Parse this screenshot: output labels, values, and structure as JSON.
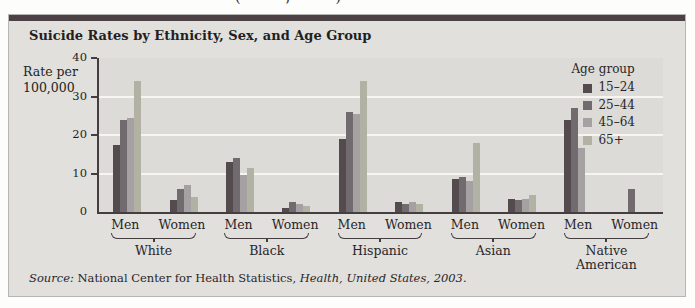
{
  "page": {
    "cropped_top_text": "(  ,  )"
  },
  "panel": {
    "title": "Suicide Rates by Ethnicity, Sex, and Age Group",
    "topbar_color": "#4c4245",
    "background_color": "#e1e0dd",
    "source": {
      "prefix_italic": "Source:",
      "middle": " National Center for Health Statistics, ",
      "citation_italic": "Health, United States, 2003",
      "suffix": "."
    }
  },
  "chart_data": {
    "type": "bar",
    "title": "Suicide Rates by Ethnicity, Sex, and Age Group",
    "ylabel_line1": "Rate per",
    "ylabel_line2": "100,000",
    "ylim": [
      0,
      40
    ],
    "yticks": [
      0,
      10,
      20,
      30,
      40
    ],
    "gridlines_at": [
      10,
      20,
      30
    ],
    "grid_color": "#f6f5f2",
    "plot_bg": "#dcdbd8",
    "axis_color": "#443e40",
    "legend": {
      "title": "Age group",
      "position": "top-right",
      "entries": [
        "15–24",
        "25–44",
        "45–64",
        "65+"
      ],
      "colors": [
        "#534b4d",
        "#716a6e",
        "#a5a1a2",
        "#b1b2a4"
      ]
    },
    "categories": [
      "White",
      "Black",
      "Hispanic",
      "Asian",
      "Native American"
    ],
    "groups": [
      {
        "ethnicity": "White",
        "clusters": [
          {
            "sex": "Men",
            "values": [
              17.5,
              24,
              24.5,
              34
            ]
          },
          {
            "sex": "Women",
            "values": [
              3,
              6,
              7,
              4
            ]
          }
        ]
      },
      {
        "ethnicity": "Black",
        "clusters": [
          {
            "sex": "Men",
            "values": [
              13,
              14,
              9.5,
              11.5
            ]
          },
          {
            "sex": "Women",
            "values": [
              1,
              2.5,
              2,
              1.5
            ]
          }
        ]
      },
      {
        "ethnicity": "Hispanic",
        "clusters": [
          {
            "sex": "Men",
            "values": [
              19,
              26,
              25.5,
              34
            ]
          },
          {
            "sex": "Women",
            "values": [
              2.5,
              2,
              2.5,
              2
            ]
          }
        ]
      },
      {
        "ethnicity": "Asian",
        "clusters": [
          {
            "sex": "Men",
            "values": [
              8.5,
              9,
              8,
              18
            ]
          },
          {
            "sex": "Women",
            "values": [
              3.5,
              3,
              3.5,
              4.5
            ]
          }
        ]
      },
      {
        "ethnicity": "Native American",
        "clusters": [
          {
            "sex": "Men",
            "values": [
              24,
              27,
              16.5,
              null
            ]
          },
          {
            "sex": "Women",
            "values": [
              null,
              6,
              null,
              null
            ]
          }
        ]
      }
    ]
  }
}
